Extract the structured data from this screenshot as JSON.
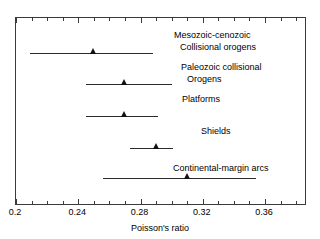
{
  "chart_data": {
    "type": "scatter",
    "title": "",
    "xlabel": "Poisson's ratio",
    "ylabel": "",
    "xlim": [
      0.2,
      0.3863
    ],
    "grid": false,
    "legend": "none",
    "xticks": [
      {
        "value": 0.2,
        "label": "0.2"
      },
      {
        "value": 0.24,
        "label": "0.24"
      },
      {
        "value": 0.28,
        "label": "0.28"
      },
      {
        "value": 0.32,
        "label": "0.32"
      },
      {
        "value": 0.36,
        "label": "0.36"
      }
    ],
    "xtick_minor_step": 0.01,
    "series": [
      {
        "name": "Mesozoic-cenozoic Collisional orogens",
        "label_line1": "Mesozoic-cenozoic",
        "label_line2": "Collisional orogens",
        "value": 0.25,
        "low": 0.209,
        "high": 0.288,
        "marker": "triangle-up"
      },
      {
        "name": "Paleozoic collisional Orogens",
        "label_line1": "Paleozoic collisional",
        "label_line2": "Orogens",
        "value": 0.27,
        "low": 0.245,
        "high": 0.3,
        "marker": "triangle-up"
      },
      {
        "name": "Platforms",
        "label_line1": "Platforms",
        "label_line2": "",
        "value": 0.27,
        "low": 0.245,
        "high": 0.291,
        "marker": "triangle-up"
      },
      {
        "name": "Shields",
        "label_line1": "Shields",
        "label_line2": "",
        "value": 0.29,
        "low": 0.273,
        "high": 0.301,
        "marker": "triangle-up"
      },
      {
        "name": "Continental-margin arcs",
        "label_line1": "Continental-margin arcs",
        "label_line2": "",
        "value": 0.31,
        "low": 0.256,
        "high": 0.354,
        "marker": "triangle-up"
      }
    ]
  },
  "axis": {
    "x_title": "Poisson's ratio",
    "tick_labels": [
      "0.2",
      "0.24",
      "0.28",
      "0.32",
      "0.36"
    ]
  },
  "colors": {
    "frame": "#3a3a3a",
    "line": "#2b2b2b",
    "marker": "#111111",
    "text": "#000000",
    "background": "#ffffff"
  }
}
